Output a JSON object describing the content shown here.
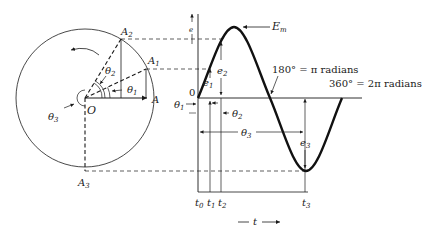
{
  "phasor": {
    "center_label": "O",
    "points": {
      "A": "A",
      "A1": {
        "base": "A",
        "sub": "1"
      },
      "A2": {
        "base": "A",
        "sub": "2"
      },
      "A3": {
        "base": "A",
        "sub": "3"
      }
    },
    "angles": {
      "theta1": {
        "base": "θ",
        "sub": "1"
      },
      "theta2": {
        "base": "θ",
        "sub": "2"
      },
      "theta3": {
        "base": "θ",
        "sub": "3"
      }
    },
    "rotation": "counterclockwise"
  },
  "waveform": {
    "axis_e": "e",
    "origin": "0",
    "peak_label": {
      "base": "E",
      "sub": "m"
    },
    "annot_180": "180° = π radians",
    "annot_360": "360° = 2π radians",
    "e1": {
      "base": "e",
      "sub": "1"
    },
    "e2": {
      "base": "e",
      "sub": "2"
    },
    "e3": {
      "base": "e",
      "sub": "3"
    },
    "theta1": {
      "base": "θ",
      "sub": "1"
    },
    "theta2": {
      "base": "θ",
      "sub": "2"
    },
    "theta3": {
      "base": "θ",
      "sub": "3"
    },
    "t0": {
      "base": "t",
      "sub": "0"
    },
    "t1": {
      "base": "t",
      "sub": "1"
    },
    "t2": {
      "base": "t",
      "sub": "2"
    },
    "t3": {
      "base": "t",
      "sub": "3"
    },
    "time_axis": "t"
  },
  "colors": {
    "ink": "#1a1a1a",
    "background": "#ffffff"
  }
}
